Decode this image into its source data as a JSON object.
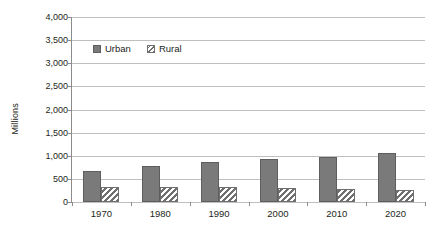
{
  "chart_data": {
    "type": "bar",
    "title": "",
    "subtitle": "",
    "xlabel": "",
    "ylabel": "Millions",
    "categories": [
      "1970",
      "1980",
      "1990",
      "2000",
      "2010",
      "2020"
    ],
    "series": [
      {
        "name": "Urban",
        "values": [
          675,
          775,
          855,
          920,
          975,
          1050
        ],
        "color": "#7a7a7a",
        "fill": "solid"
      },
      {
        "name": "Rural",
        "values": [
          335,
          325,
          315,
          305,
          280,
          250
        ],
        "color": "#6f6f6f",
        "fill": "diagonal-hatch"
      }
    ],
    "ylim": [
      0,
      4000
    ],
    "ytick_values": [
      0,
      500,
      1000,
      1500,
      2000,
      2500,
      3000,
      3500,
      4000
    ],
    "ytick_labels": [
      "0",
      "500",
      "1,000",
      "1,500",
      "2,000",
      "2,500",
      "3,000",
      "3,500",
      "4,000"
    ],
    "grid": true,
    "grid_axis": "y",
    "legend_position": "upper-left-inside",
    "legend_entries": [
      "Urban",
      "Rural"
    ],
    "annotations": []
  },
  "colors": {
    "urban_fill": "#7a7a7a",
    "urban_border": "#5e5e5e",
    "rural_fill": "#ffffff",
    "rural_hatch": "#6f6f6f",
    "gridline": "#bfbfbf",
    "axis": "#8c8c8c",
    "text": "#231f20",
    "background": "#ffffff"
  }
}
